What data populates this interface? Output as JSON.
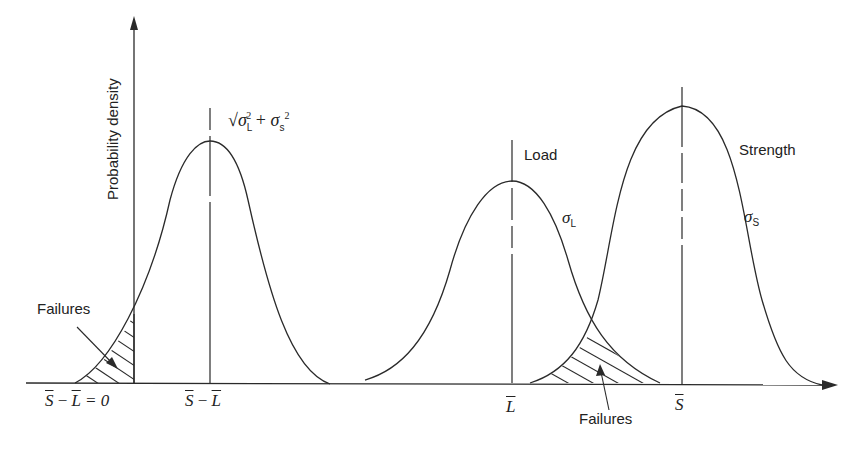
{
  "figure": {
    "y_axis_label": "Probability density",
    "combined_sigma_label": {
      "radical": "√",
      "sigma": "σ",
      "sub_L": "L",
      "sup_2a": "2",
      "plus": " + ",
      "sigma2": "σ",
      "sub_s": "s",
      "sup_2b": "2"
    },
    "load_label": "Load",
    "strength_label": "Strength",
    "sigma_L": {
      "sigma": "σ",
      "sub": "L"
    },
    "sigma_S": {
      "sigma": "σ",
      "sub": "S"
    },
    "failures_left_label": "Failures",
    "failures_right_label": "Failures",
    "x_ticks": {
      "zero": {
        "S": "S",
        "minus": " − ",
        "L": "L",
        "eq": " = 0"
      },
      "margin": {
        "S": "S",
        "minus": " − ",
        "L": "L"
      },
      "load_mean": "L",
      "strength_mean": "S"
    }
  },
  "colors": {
    "line": "#2a2a2a",
    "background": "#ffffff"
  }
}
